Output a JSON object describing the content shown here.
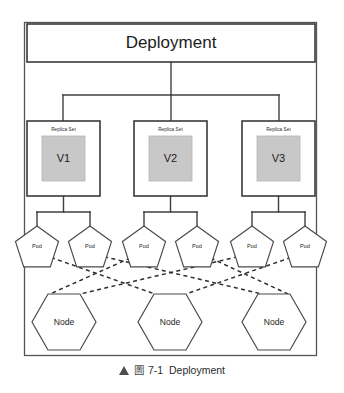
{
  "figure": {
    "caption_marker": "▲",
    "caption_glyph": "圖",
    "caption_text": "7-1  Deployment",
    "frame_color": "#555555",
    "gray_fill_color": "#c8c8c8"
  },
  "diagram": {
    "type": "hierarchy",
    "root": {
      "label": "Deployment"
    },
    "replica_sets": [
      {
        "title": "Replica Set",
        "version": "V1"
      },
      {
        "title": "Replica Set",
        "version": "V2"
      },
      {
        "title": "Replica Set",
        "version": "V3"
      }
    ],
    "pods": [
      {
        "label": "Pod"
      },
      {
        "label": "Pod"
      },
      {
        "label": "Pod"
      },
      {
        "label": "Pod"
      },
      {
        "label": "Pod"
      },
      {
        "label": "Pod"
      }
    ],
    "nodes": [
      {
        "label": "Node"
      },
      {
        "label": "Node"
      },
      {
        "label": "Node"
      }
    ]
  }
}
